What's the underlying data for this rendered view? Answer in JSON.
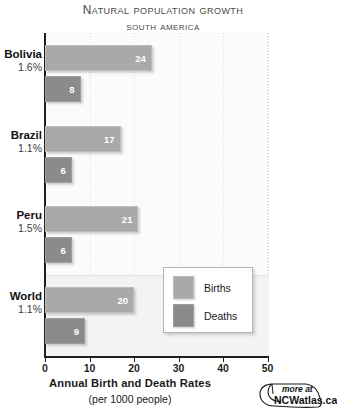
{
  "title": {
    "main": "Natural Population Growth",
    "sub": "South America"
  },
  "legend": {
    "items": [
      {
        "label": "Births",
        "color": "#a9a9a9",
        "icon": "legend-swatch-births"
      },
      {
        "label": "Deaths",
        "color": "#8b8b8b",
        "icon": "legend-swatch-deaths"
      }
    ]
  },
  "axis": {
    "caption_line1": "Annual Birth and Death Rates",
    "caption_line2": "(per 1000 people)",
    "ticks": [
      "0",
      "10",
      "20",
      "30",
      "40",
      "50"
    ]
  },
  "logo": {
    "more_at": "more at",
    "site": "NCWatlas.ca",
    "icon": "mouse-icon"
  },
  "chart_data": {
    "type": "bar",
    "orientation": "horizontal",
    "xlabel": "Annual Birth and Death Rates (per 1000 people)",
    "ylabel": "",
    "xlim": [
      0,
      50
    ],
    "xticks": [
      0,
      10,
      20,
      30,
      40,
      50
    ],
    "grid": true,
    "legend_position": "inside-right",
    "categories": [
      "Bolivia",
      "Brazil",
      "Peru",
      "World"
    ],
    "category_annotations": [
      "1.6%",
      "1.1%",
      "1.5%",
      "1.1%"
    ],
    "series": [
      {
        "name": "Births",
        "color": "#a9a9a9",
        "values": [
          24,
          17,
          21,
          20
        ]
      },
      {
        "name": "Deaths",
        "color": "#8b8b8b",
        "values": [
          8,
          6,
          6,
          9
        ]
      }
    ]
  }
}
